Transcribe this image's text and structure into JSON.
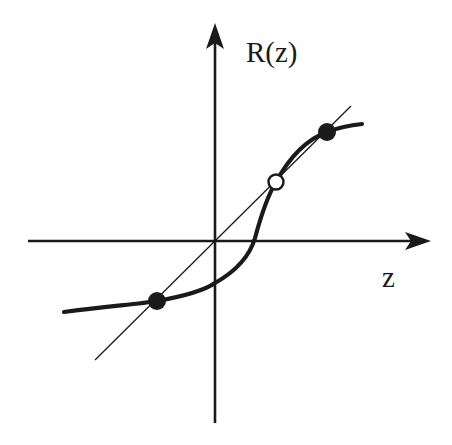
{
  "diagram": {
    "type": "function-plot",
    "axes": {
      "x_label": "z",
      "y_label": "R(z)"
    },
    "colors": {
      "ink": "#1a1a1a",
      "background": "#ffffff"
    },
    "elements": {
      "curve": "R(z) response curve (thick)",
      "identity_line": "R(z) = z diagonal (thin)",
      "fixed_points": [
        {
          "label": "lower stable fixed point",
          "marker": "filled"
        },
        {
          "label": "middle unstable fixed point",
          "marker": "open"
        },
        {
          "label": "upper stable fixed point",
          "marker": "filled"
        }
      ]
    }
  }
}
